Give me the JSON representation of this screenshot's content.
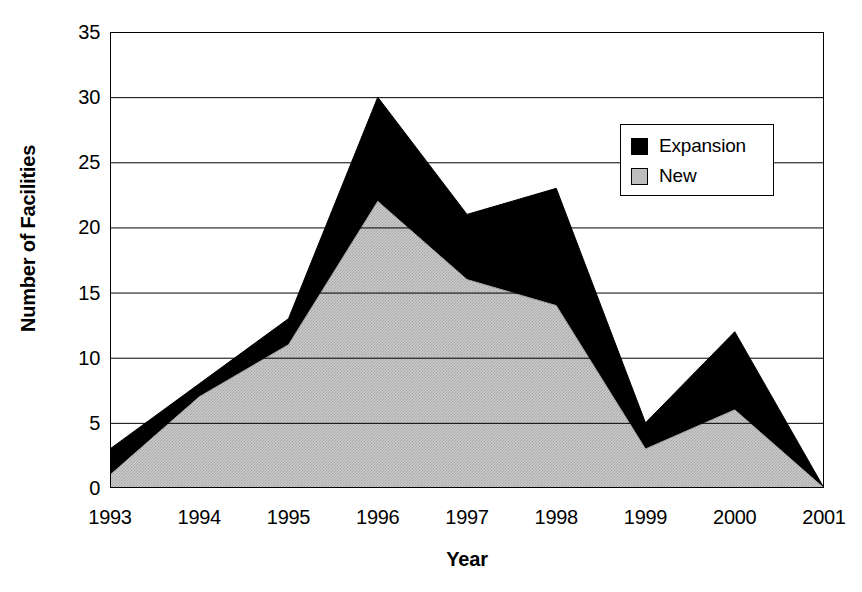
{
  "chart_data": {
    "type": "area",
    "stacked": true,
    "title": "",
    "subtitle": "",
    "xlabel": "Year",
    "ylabel": "Number of Facilities",
    "categories": [
      "1993",
      "1994",
      "1995",
      "1996",
      "1997",
      "1998",
      "1999",
      "2000",
      "2001"
    ],
    "x": [
      1993,
      1994,
      1995,
      1996,
      1997,
      1998,
      1999,
      2000,
      2001
    ],
    "series": [
      {
        "name": "New",
        "color": "#bdbdbd",
        "values": [
          1,
          7,
          11,
          22,
          16,
          14,
          3,
          6,
          0
        ]
      },
      {
        "name": "Expansion",
        "color": "#000000",
        "values": [
          2,
          1,
          2,
          8,
          5,
          9,
          2,
          6,
          0
        ]
      }
    ],
    "stacked_totals": [
      3,
      8,
      13,
      30,
      21,
      23,
      5,
      12,
      0
    ],
    "ylim": [
      0,
      35
    ],
    "yticks": [
      0,
      5,
      10,
      15,
      20,
      25,
      30,
      35
    ],
    "ytick_labels": [
      "0",
      "5",
      "10",
      "15",
      "20",
      "25",
      "30",
      "35"
    ],
    "xlim": [
      1993,
      2001
    ],
    "grid": "horizontal",
    "legend_position": "upper-right-inside",
    "legend_entries": [
      {
        "label": "Expansion",
        "color": "#000000"
      },
      {
        "label": "New",
        "color": "#bdbdbd"
      }
    ]
  },
  "colors": {
    "expansion": "#000000",
    "new": "#bdbdbd",
    "axis": "#000000",
    "grid": "#000000",
    "background": "#ffffff"
  }
}
